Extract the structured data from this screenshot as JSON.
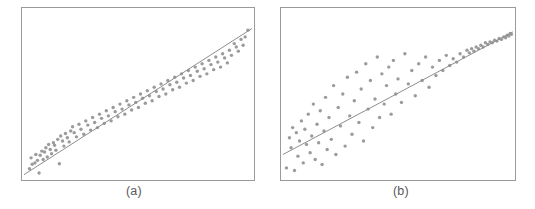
{
  "figure": {
    "background_color": "#ffffff",
    "panel_count": 2
  },
  "panels": [
    {
      "id": "a",
      "caption": "(a)",
      "frame": {
        "x": 21,
        "y": 7,
        "width": 234,
        "height": 174
      },
      "frame_color": "#9a9a9c",
      "point_color": "#9b9b9d",
      "line_color": "#8e8e90"
    },
    {
      "id": "b",
      "caption": "(b)",
      "frame": {
        "x": 13,
        "y": 7,
        "width": 236,
        "height": 174
      },
      "frame_color": "#9a9a9c",
      "point_color": "#9b9b9d",
      "line_color": "#8e8e90"
    }
  ],
  "chart_data": [
    {
      "type": "scatter",
      "title": "(a)",
      "subtitle": "",
      "xlabel": "",
      "ylabel": "",
      "xlim": [
        0,
        100
      ],
      "ylim": [
        0,
        100
      ],
      "grid": false,
      "legend": null,
      "annotations": [
        "homoscedastic residual scatter about the regression line"
      ],
      "series": [
        {
          "name": "observations",
          "marker": "circle",
          "color": "#9b9b9d",
          "x": [
            2.4,
            3.1,
            3.6,
            4.8,
            5.2,
            5.9,
            6.6,
            7.1,
            7.8,
            8.4,
            9.0,
            9.6,
            10.2,
            10.8,
            11.5,
            12.1,
            12.9,
            13.4,
            14.0,
            14.8,
            15.5,
            16.1,
            16.9,
            17.5,
            18.2,
            19.0,
            19.8,
            20.5,
            21.3,
            22.0,
            23.0,
            24.1,
            25.0,
            26.2,
            27.1,
            28.0,
            29.2,
            30.1,
            31.0,
            32.2,
            33.1,
            34.0,
            35.2,
            36.1,
            37.0,
            38.2,
            39.1,
            40.0,
            41.2,
            42.1,
            43.0,
            44.2,
            45.1,
            46.0,
            47.2,
            48.1,
            49.0,
            50.2,
            51.1,
            52.0,
            53.2,
            54.1,
            55.0,
            56.2,
            57.1,
            58.0,
            59.2,
            60.1,
            61.0,
            62.2,
            63.1,
            64.0,
            65.2,
            66.1,
            67.0,
            68.2,
            69.1,
            70.0,
            71.2,
            72.1,
            73.0,
            74.2,
            75.1,
            76.0,
            77.2,
            78.1,
            79.0,
            80.2,
            81.1,
            82.0,
            83.2,
            84.1,
            85.0,
            86.2,
            87.1,
            88.0,
            89.2,
            90.1,
            91.0,
            92.2,
            93.1,
            94.0,
            95.2,
            96.1,
            97.0,
            98.2
          ],
          "y": [
            5.5,
            12.0,
            8.2,
            9.0,
            14.0,
            10.5,
            3.0,
            13.5,
            16.0,
            11.0,
            15.5,
            18.0,
            12.5,
            20.0,
            17.0,
            14.5,
            21.0,
            19.5,
            16.5,
            23.0,
            8.5,
            25.0,
            22.0,
            19.0,
            26.5,
            24.0,
            21.5,
            28.0,
            30.5,
            27.0,
            24.5,
            32.0,
            29.0,
            26.0,
            34.0,
            31.5,
            28.5,
            36.0,
            33.0,
            30.0,
            38.0,
            35.5,
            32.5,
            40.0,
            37.0,
            34.0,
            42.0,
            39.5,
            36.5,
            44.0,
            41.0,
            38.0,
            46.0,
            43.5,
            40.5,
            48.0,
            45.0,
            42.0,
            50.0,
            47.5,
            44.5,
            52.0,
            49.0,
            46.0,
            54.0,
            51.5,
            48.5,
            56.0,
            53.0,
            50.0,
            58.0,
            55.5,
            52.5,
            60.0,
            57.0,
            54.0,
            62.0,
            59.5,
            56.5,
            64.0,
            61.0,
            58.0,
            66.0,
            63.5,
            60.5,
            68.0,
            65.0,
            62.0,
            70.0,
            67.5,
            64.5,
            72.0,
            69.0,
            66.0,
            74.0,
            71.5,
            68.5,
            76.0,
            73.0,
            80.0,
            78.0,
            75.5,
            82.5,
            79.0,
            84.0,
            88.0
          ]
        }
      ],
      "fit_line": {
        "name": "regression line",
        "color": "#8e8e90",
        "x": [
          0,
          100
        ],
        "y": [
          2.0,
          89.0
        ]
      }
    },
    {
      "type": "scatter",
      "title": "(b)",
      "subtitle": "",
      "xlabel": "",
      "ylabel": "",
      "xlim": [
        0,
        100
      ],
      "ylim": [
        0,
        100
      ],
      "grid": false,
      "legend": null,
      "annotations": [
        "heteroscedastic residual scatter: variance decreases as x increases"
      ],
      "series": [
        {
          "name": "observations",
          "marker": "circle",
          "color": "#9b9b9d",
          "x": [
            1.5,
            2.8,
            3.5,
            4.2,
            5.0,
            5.8,
            6.5,
            7.2,
            8.0,
            8.8,
            9.5,
            10.2,
            11.0,
            11.8,
            12.5,
            13.2,
            14.0,
            14.8,
            15.5,
            16.2,
            17.0,
            17.8,
            18.5,
            19.2,
            20.0,
            21.0,
            22.0,
            23.0,
            24.0,
            25.0,
            26.0,
            27.0,
            28.0,
            29.0,
            30.0,
            31.0,
            32.0,
            33.0,
            34.0,
            35.0,
            36.0,
            37.0,
            38.0,
            39.0,
            40.0,
            41.0,
            42.0,
            43.0,
            44.0,
            45.0,
            46.0,
            47.0,
            48.0,
            49.0,
            50.0,
            51.5,
            53.0,
            54.5,
            56.0,
            57.5,
            59.0,
            60.5,
            62.0,
            63.5,
            65.0,
            66.5,
            68.0,
            69.5,
            71.0,
            72.5,
            74.0,
            75.5,
            77.0,
            78.5,
            80.0,
            81.0,
            82.0,
            83.0,
            84.0,
            85.0,
            86.0,
            87.0,
            88.0,
            89.0,
            90.0,
            91.0,
            92.0,
            93.0,
            94.0,
            95.0,
            96.0,
            96.8,
            97.5,
            98.2,
            98.8,
            99.3
          ],
          "y": [
            6.0,
            24.0,
            18.0,
            30.0,
            4.5,
            27.0,
            13.0,
            22.0,
            34.0,
            9.0,
            29.0,
            20.0,
            38.0,
            15.0,
            25.0,
            44.0,
            11.0,
            32.0,
            21.0,
            40.0,
            8.0,
            28.0,
            48.0,
            17.0,
            36.0,
            23.0,
            55.0,
            14.0,
            42.0,
            31.0,
            50.0,
            19.0,
            60.0,
            37.0,
            26.0,
            46.0,
            63.0,
            33.0,
            53.0,
            22.0,
            68.0,
            41.0,
            58.0,
            30.0,
            47.0,
            72.0,
            36.0,
            62.0,
            44.0,
            55.0,
            66.0,
            38.0,
            70.0,
            50.0,
            59.0,
            45.0,
            74.0,
            56.0,
            64.0,
            49.0,
            68.0,
            58.0,
            72.0,
            54.0,
            66.0,
            61.0,
            70.0,
            64.0,
            73.0,
            67.0,
            71.0,
            69.0,
            74.0,
            72.0,
            76.0,
            74.5,
            77.0,
            75.5,
            78.0,
            77.0,
            79.0,
            78.0,
            80.5,
            79.5,
            81.0,
            80.5,
            82.0,
            81.5,
            83.0,
            82.5,
            84.0,
            83.5,
            85.0,
            84.5,
            86.0,
            85.5
          ]
        }
      ],
      "fit_line": {
        "name": "regression line",
        "color": "#8e8e90",
        "x": [
          0,
          100
        ],
        "y": [
          14.0,
          87.0
        ]
      }
    }
  ]
}
